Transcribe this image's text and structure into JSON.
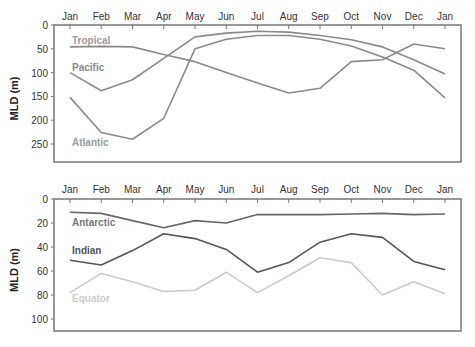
{
  "chart_data": [
    {
      "type": "line",
      "title": "",
      "xlabel": "",
      "ylabel": "MLD (m)",
      "ylim": [
        0,
        270
      ],
      "yreversed": true,
      "yticks": [
        0,
        50,
        100,
        150,
        200,
        250
      ],
      "categories": [
        "Jan",
        "Feb",
        "Mar",
        "Apr",
        "May",
        "Jun",
        "Jul",
        "Aug",
        "Sep",
        "Oct",
        "Nov",
        "Dec",
        "Jan"
      ],
      "grid": false,
      "series": [
        {
          "name": "Tropical",
          "color": "#8a8a8a",
          "label_color": "#9a9a9a",
          "values": [
            46,
            45,
            46,
            62,
            77,
            100,
            122,
            143,
            133,
            77,
            73,
            40,
            50
          ]
        },
        {
          "name": "Pacific",
          "color": "#8a8a8a",
          "label_color": "#8a8a8a",
          "values": [
            100,
            138,
            115,
            70,
            25,
            17,
            13,
            15,
            22,
            31,
            46,
            73,
            103
          ]
        },
        {
          "name": "Atlantic",
          "color": "#8a8a8a",
          "label_color": "#9a9a9a",
          "values": [
            152,
            226,
            240,
            196,
            50,
            30,
            22,
            22,
            30,
            44,
            67,
            95,
            153
          ]
        }
      ]
    },
    {
      "type": "line",
      "title": "",
      "xlabel": "",
      "ylabel": "MLD (m)",
      "ylim": [
        0,
        110
      ],
      "yreversed": true,
      "yticks": [
        0,
        20,
        40,
        60,
        80,
        100
      ],
      "categories": [
        "Jan",
        "Feb",
        "Mar",
        "Apr",
        "May",
        "Jun",
        "Jul",
        "Aug",
        "Sep",
        "Oct",
        "Nov",
        "Dec",
        "Jan"
      ],
      "grid": false,
      "series": [
        {
          "name": "Antarctic",
          "color": "#666666",
          "label_color": "#777777",
          "values": [
            11,
            12,
            18,
            24,
            18,
            20,
            13,
            13,
            13,
            12.5,
            12,
            13,
            12.5
          ]
        },
        {
          "name": "Indian",
          "color": "#555555",
          "label_color": "#555555",
          "values": [
            51,
            55,
            43,
            29,
            33,
            42,
            61,
            53,
            36,
            29,
            32,
            52,
            59
          ]
        },
        {
          "name": "Equator",
          "color": "#cccccc",
          "label_color": "#cccccc",
          "values": [
            78,
            62,
            69,
            77,
            76,
            61,
            78,
            64,
            49,
            53,
            80,
            69,
            79
          ]
        }
      ]
    }
  ]
}
